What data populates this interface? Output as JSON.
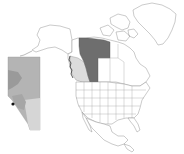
{
  "map": {
    "title": "",
    "type": "locator-map",
    "region": "North America",
    "colors": {
      "background": "#ffffff",
      "land": "#ffffff",
      "borders": "#8a8a8a",
      "highlight_dark": "#6e6e6e",
      "highlight_light": "#dcdcdc",
      "inset_base": "#b4b4b4",
      "inset_mid": "#9a9a9a",
      "inset_light": "#d6d6d6",
      "marker": "#111111"
    },
    "highlighted_regions": [
      {
        "name": "dark-region",
        "shade": "dark"
      },
      {
        "name": "light-region",
        "shade": "light"
      }
    ],
    "inset": {
      "name": "province-inset",
      "marker": "point"
    }
  }
}
